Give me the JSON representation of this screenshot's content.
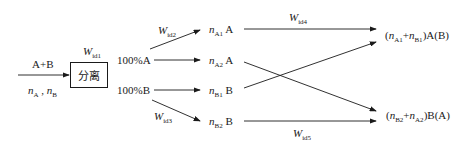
{
  "diagram": {
    "input": {
      "label": "A+B",
      "flow_n1": "n",
      "flow_n1_sub": "A",
      "flow_sep": " , ",
      "flow_n2": "n",
      "flow_n2_sub": "B"
    },
    "separator": {
      "label": "分离",
      "work_symbol": "W",
      "work_sub": "id1"
    },
    "outputs": {
      "a_pure": "100%A",
      "b_pure": "100%B"
    },
    "weights": {
      "w2": {
        "symbol": "W",
        "sub": "id2"
      },
      "w3": {
        "symbol": "W",
        "sub": "id3"
      },
      "w4": {
        "symbol": "W",
        "sub": "id4"
      },
      "w5": {
        "symbol": "W",
        "sub": "id5"
      }
    },
    "split_streams": [
      {
        "n": "n",
        "sub": "A1",
        "species": "A"
      },
      {
        "n": "n",
        "sub": "A2",
        "species": "A"
      },
      {
        "n": "n",
        "sub": "B1",
        "species": "B"
      },
      {
        "n": "n",
        "sub": "B2",
        "species": "B"
      }
    ],
    "mixtures": {
      "top": {
        "open": "(",
        "n1": "n",
        "n1_sub": "A1",
        "plus": "+",
        "n2": "n",
        "n2_sub": "B1",
        "close": ")A(B)"
      },
      "bottom": {
        "open": "(",
        "n1": "n",
        "n1_sub": "B2",
        "plus": "+",
        "n2": "n",
        "n2_sub": "A2",
        "close": ")B(A)"
      }
    },
    "colors": {
      "line": "#1a1a1a",
      "background": "#ffffff"
    }
  }
}
